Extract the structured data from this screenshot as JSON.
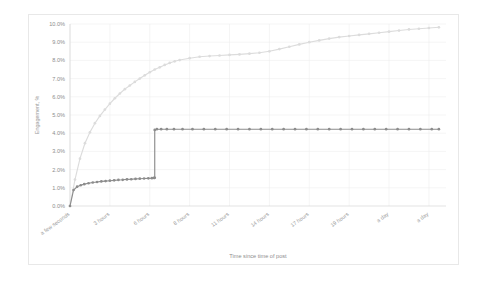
{
  "chart_data": {
    "type": "line",
    "title": "",
    "xlabel": "Time since time of post",
    "ylabel": "Engagement, %",
    "ylim": [
      0,
      10
    ],
    "ytick_labels": [
      "0.0%",
      "1.0%",
      "2.0%",
      "3.0%",
      "4.0%",
      "5.0%",
      "6.0%",
      "7.0%",
      "8.0%",
      "9.0%",
      "10.0%"
    ],
    "ytick_values": [
      0,
      1,
      2,
      3,
      4,
      5,
      6,
      7,
      8,
      9,
      10
    ],
    "xtick_labels": [
      "a few seconds",
      "3 hours",
      "6 hours",
      "8 hours",
      "11 hours",
      "14 hours",
      "17 hours",
      "19 hours",
      "a day",
      "a day"
    ],
    "xtick_positions": [
      0,
      2.8,
      5.6,
      8.4,
      11.2,
      14.0,
      16.8,
      19.6,
      22.4,
      25.2
    ],
    "xlim": [
      0,
      26.4
    ],
    "grid": true,
    "legend_position": "none",
    "series": [
      {
        "name": "cumulative-engagement",
        "color": "#dcdcdc",
        "marker": "circle",
        "x": [
          0,
          0.35,
          0.7,
          1.05,
          1.4,
          1.75,
          2.1,
          2.45,
          2.8,
          3.15,
          3.5,
          3.85,
          4.2,
          4.55,
          4.9,
          5.25,
          5.6,
          5.95,
          6.3,
          6.65,
          7.0,
          7.35,
          7.7,
          8.4,
          9.1,
          9.8,
          10.5,
          11.2,
          11.9,
          12.6,
          13.3,
          14.0,
          14.7,
          15.4,
          16.1,
          16.8,
          17.5,
          18.2,
          18.9,
          19.6,
          20.3,
          21.0,
          21.7,
          22.4,
          23.1,
          23.8,
          24.5,
          25.2,
          25.9
        ],
        "y": [
          0.0,
          1.45,
          2.6,
          3.45,
          4.05,
          4.55,
          4.95,
          5.3,
          5.62,
          5.92,
          6.18,
          6.42,
          6.62,
          6.82,
          7.0,
          7.18,
          7.35,
          7.5,
          7.62,
          7.75,
          7.86,
          7.95,
          8.02,
          8.12,
          8.2,
          8.24,
          8.27,
          8.3,
          8.33,
          8.37,
          8.42,
          8.5,
          8.62,
          8.75,
          8.88,
          9.0,
          9.1,
          9.2,
          9.28,
          9.34,
          9.4,
          9.46,
          9.52,
          9.58,
          9.64,
          9.7,
          9.74,
          9.78,
          9.82
        ]
      },
      {
        "name": "step-engagement",
        "color": "#8c8c8c",
        "marker": "circle",
        "x": [
          0,
          0.25,
          0.5,
          0.75,
          1.0,
          1.3,
          1.6,
          1.9,
          2.2,
          2.5,
          2.8,
          3.1,
          3.4,
          3.7,
          4.0,
          4.3,
          4.6,
          4.9,
          5.2,
          5.5,
          5.75,
          5.9,
          5.95,
          5.95,
          6.1,
          6.4,
          6.8,
          7.3,
          7.9,
          8.6,
          9.4,
          10.2,
          11.0,
          11.8,
          12.6,
          13.4,
          14.2,
          15.0,
          15.8,
          16.6,
          17.4,
          18.2,
          19.0,
          19.8,
          20.6,
          21.4,
          22.2,
          23.0,
          23.8,
          24.6,
          25.4,
          25.9
        ],
        "y": [
          0.0,
          0.88,
          1.06,
          1.14,
          1.2,
          1.25,
          1.29,
          1.32,
          1.35,
          1.37,
          1.39,
          1.41,
          1.43,
          1.44,
          1.46,
          1.47,
          1.49,
          1.5,
          1.51,
          1.52,
          1.53,
          1.54,
          1.55,
          4.18,
          4.22,
          4.22,
          4.22,
          4.22,
          4.22,
          4.22,
          4.22,
          4.22,
          4.22,
          4.22,
          4.22,
          4.22,
          4.22,
          4.22,
          4.22,
          4.22,
          4.22,
          4.22,
          4.22,
          4.22,
          4.22,
          4.22,
          4.22,
          4.22,
          4.22,
          4.22,
          4.22,
          4.22
        ]
      }
    ]
  },
  "colors": {
    "grid": "#ededed",
    "axis": "#d2d2d2",
    "tick_text": "#8d8d8d",
    "card_border": "#e8e8e8"
  }
}
